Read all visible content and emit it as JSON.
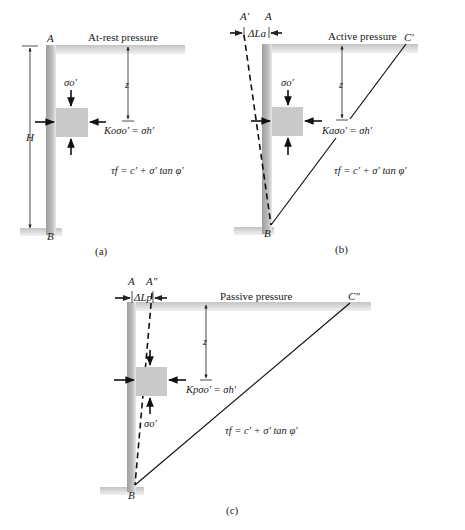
{
  "colors": {
    "wall": "#b9b9b9",
    "ground": "#d0d0d0",
    "element": "#c8c8c8",
    "ink": "#111111"
  },
  "panels": [
    {
      "id": "a",
      "title": "At-rest pressure",
      "caption": "(a)",
      "top_label": "A",
      "bottom_label": "B",
      "height_label": "H",
      "depth_label": "z",
      "vertical_stress": "σo′",
      "horizontal_eq": "Koσo′ = σh′",
      "shear_eq": "τf = c′ + σ′ tan φ′"
    },
    {
      "id": "b",
      "title": "Active pressure",
      "caption": "(b)",
      "top_label": "A",
      "moved_label": "A′",
      "displacement_label": "ΔLa",
      "wedge_label": "C′",
      "bottom_label": "B",
      "depth_label": "z",
      "vertical_stress": "σo′",
      "horizontal_eq": "Kaσo′ = σh′",
      "shear_eq": "τf = c′ + σ′ tan φ′"
    },
    {
      "id": "c",
      "title": "Passive pressure",
      "caption": "(c)",
      "top_label": "A",
      "moved_label": "A″",
      "displacement_label": "ΔLp",
      "wedge_label": "C″",
      "bottom_label": "B",
      "depth_label": "z",
      "vertical_stress": "σo′",
      "horizontal_eq": "Kpσo′ = σh′",
      "shear_eq": "τf = c′ + σ′ tan φ′"
    }
  ]
}
